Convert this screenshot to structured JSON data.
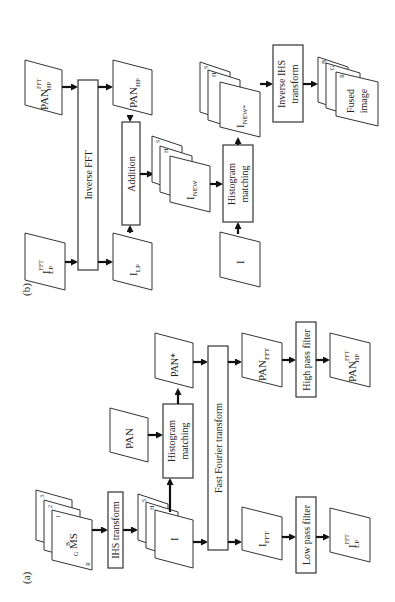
{
  "panels": {
    "a": {
      "label": "(a)",
      "ms_stack": {
        "front": "MS",
        "band_labels": [
          "R",
          "G",
          "B"
        ],
        "band_numbers": [
          "1",
          "2",
          "3"
        ]
      },
      "ihs_transform": "IHS transform",
      "ihs_stack": {
        "front": "I",
        "back": [
          "H",
          "S"
        ]
      },
      "pan": "PAN",
      "histogram_matching": [
        "Histogram",
        "matching"
      ],
      "pan_star": "PAN*",
      "fft": "Fast Fourier transform",
      "i_fft": {
        "base": "I",
        "sub": "FFT"
      },
      "pan_fft": {
        "base": "PAN",
        "sub": "FFT"
      },
      "low_pass": "Low pass filter",
      "high_pass": "High pass filter",
      "i_lp_fft": {
        "base": "I",
        "sup": "FFT",
        "sub": "LP"
      },
      "pan_hp_fft": {
        "base": "PAN",
        "sup": "FFT",
        "sub": "HP"
      }
    },
    "b": {
      "label": "(b)",
      "i_lp_fft": {
        "base": "I",
        "sup": "FFT",
        "sub": "LP"
      },
      "pan_hp_fft": {
        "base": "PAN",
        "sup": "FFT",
        "sub": "HP"
      },
      "inverse_fft": "Inverse FFT",
      "i_lp": {
        "base": "I",
        "sub": "LP"
      },
      "pan_hp": {
        "base": "PAN",
        "sub": "HP"
      },
      "addition": "Addition",
      "new_stack": {
        "front_base": "I",
        "front_sub": "NEW",
        "back": [
          "H",
          "S"
        ]
      },
      "i": "I",
      "histogram_matching": [
        "Histogram",
        "matching"
      ],
      "new_star_stack": {
        "front_base": "I",
        "front_sub": "NEW*",
        "back": [
          "H",
          "S"
        ]
      },
      "inverse_ihs": [
        "Inverse IHS",
        "transform"
      ],
      "fused_stack": {
        "front": [
          "Fused",
          "image"
        ],
        "band_labels": [
          "B",
          "G",
          "R"
        ]
      }
    }
  }
}
